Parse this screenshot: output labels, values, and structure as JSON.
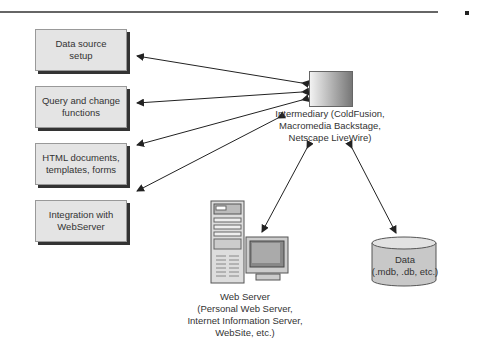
{
  "diagram": {
    "left_boxes": [
      {
        "label_line1": "Data source",
        "label_line2": "setup"
      },
      {
        "label_line1": "Query and change",
        "label_line2": "functions"
      },
      {
        "label_line1": "HTML documents,",
        "label_line2": "templates, forms"
      },
      {
        "label_line1": "Integration with",
        "label_line2": "WebServer"
      }
    ],
    "intermediary": {
      "line1": "Intermediary (ColdFusion,",
      "line2": "Macromedia Backstage,",
      "line3": "Netscape LiveWire)"
    },
    "web_server": {
      "line1": "Web Server",
      "line2": "(Personal Web Server,",
      "line3": "Internet Information Server,",
      "line4": "WebSite, etc.)"
    },
    "data_store": {
      "line1": "Data",
      "line2": "(.mdb, .db, etc.)"
    },
    "colors": {
      "box_fill": "#e4e4e4",
      "shadow": "#333333",
      "line": "#222222"
    }
  }
}
